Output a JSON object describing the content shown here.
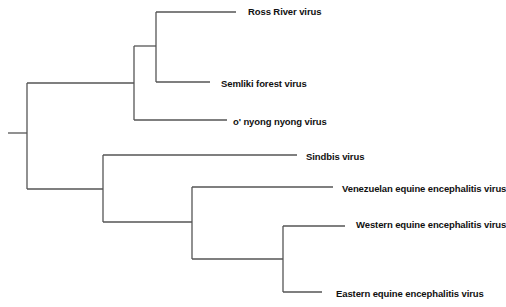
{
  "line_color": "#555555",
  "text_color": "#111111",
  "leaves": [
    {
      "id": "rr",
      "label": "Ross River virus"
    },
    {
      "id": "sf",
      "label": "Semliki forest virus"
    },
    {
      "id": "onn",
      "label": "o' nyong nyong virus"
    },
    {
      "id": "sin",
      "label": "Sindbis virus"
    },
    {
      "id": "vee",
      "label": "Venezuelan equine encephalitis virus"
    },
    {
      "id": "wee",
      "label": "Western equine encephalitis virus"
    },
    {
      "id": "eee",
      "label": "Eastern equine encephalitis virus"
    }
  ],
  "topology": "(((Ross River virus, Semliki forest virus), o' nyong nyong virus), (Sindbis virus, (Venezuelan equine encephalitis virus, (Western equine encephalitis virus, Eastern equine encephalitis virus))))"
}
